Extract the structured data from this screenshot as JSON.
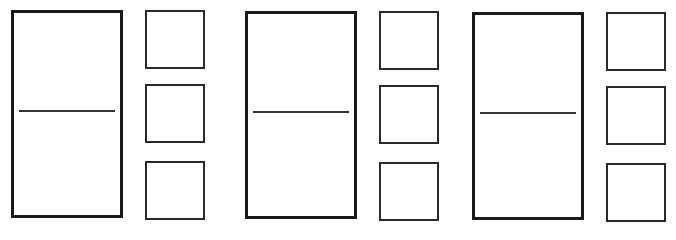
{
  "diagram": {
    "colors": {
      "stroke": "#1a1a1a",
      "background": "#ffffff"
    },
    "groups": [
      {
        "domino": {
          "x": 11,
          "y": 10,
          "w": 112,
          "h": 208,
          "divider_y": 110,
          "top_label": "",
          "bottom_label": ""
        },
        "squares": [
          {
            "x": 145,
            "y": 10,
            "w": 60,
            "h": 59,
            "label": ""
          },
          {
            "x": 145,
            "y": 84,
            "w": 60,
            "h": 59,
            "label": ""
          },
          {
            "x": 145,
            "y": 161,
            "w": 60,
            "h": 59,
            "label": ""
          }
        ]
      },
      {
        "domino": {
          "x": 245,
          "y": 11,
          "w": 112,
          "h": 208,
          "divider_y": 111,
          "top_label": "",
          "bottom_label": ""
        },
        "squares": [
          {
            "x": 379,
            "y": 11,
            "w": 60,
            "h": 59,
            "label": ""
          },
          {
            "x": 379,
            "y": 85,
            "w": 60,
            "h": 59,
            "label": ""
          },
          {
            "x": 379,
            "y": 162,
            "w": 60,
            "h": 59,
            "label": ""
          }
        ]
      },
      {
        "domino": {
          "x": 472,
          "y": 12,
          "w": 112,
          "h": 208,
          "divider_y": 112,
          "top_label": "",
          "bottom_label": ""
        },
        "squares": [
          {
            "x": 606,
            "y": 12,
            "w": 60,
            "h": 59,
            "label": ""
          },
          {
            "x": 606,
            "y": 86,
            "w": 60,
            "h": 59,
            "label": ""
          },
          {
            "x": 606,
            "y": 163,
            "w": 60,
            "h": 59,
            "label": ""
          }
        ]
      }
    ]
  }
}
